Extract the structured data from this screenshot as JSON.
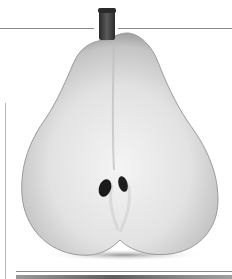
{
  "image": {
    "subject": "halved pear, grayscale photograph",
    "colors": {
      "background": "#ffffff",
      "flesh_light": "#f2f2f2",
      "flesh_mid": "#d4d4d4",
      "flesh_edge": "#a8a8a8",
      "stem": "#3a3a3a",
      "seeds": "#1a1a1a",
      "rule_lines": "#8a8a8a"
    }
  }
}
